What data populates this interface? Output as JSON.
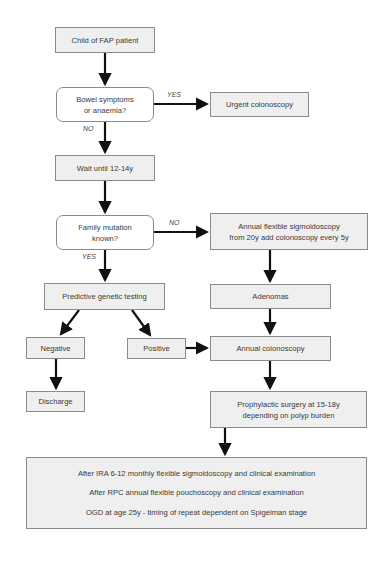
{
  "nodes": {
    "child_fap": "Child of FAP patient",
    "bowel_symptoms": "Bowel symptoms\nor anaemia?",
    "urgent_colonoscopy": "Urgent colonoscopy",
    "wait": "Wait until 12-14y",
    "family_mutation": "Family mutation\nknown?",
    "annual_flex_sig": "Annual flexible sigmoidoscopy\nfrom 20y add colonoscopy every 5y",
    "predictive_testing": "Predictive genetic testing",
    "adenomas": "Adenomas",
    "negative": "Negative",
    "positive": "Positive",
    "annual_colonoscopy": "Annual colonoscopy",
    "discharge": "Discharge",
    "prophylactic_surgery": "Prophylactic surgery at 15-18y\ndepending on polyp burden",
    "followup": [
      "After IRA 6-12 monthly flexible sigmoidoscopy and clinical examination",
      "After RPC annual flexible pouchoscopy and clinical examination",
      "OGD at age 25y - timing of repeat dependent on Spigelman stage"
    ]
  },
  "edge_labels": {
    "bowel_yes": "YES",
    "bowel_no": "NO",
    "mutation_no": "NO",
    "mutation_yes": "YES"
  }
}
